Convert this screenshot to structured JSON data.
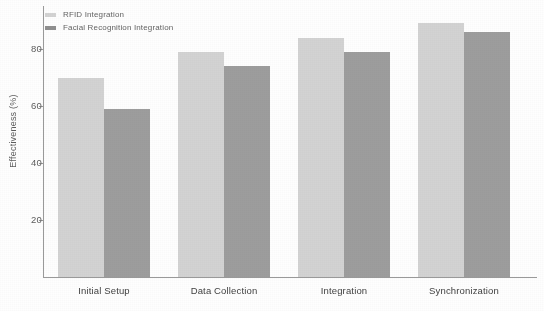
{
  "chart_data": {
    "type": "bar",
    "title": "",
    "xlabel": "",
    "ylabel": "Effectiveness (%)",
    "categories": [
      "Initial Setup",
      "Data Collection",
      "Integration",
      "Synchronization"
    ],
    "series": [
      {
        "name": "RFID Integration",
        "color": "#d3d3d3",
        "values": [
          70,
          79,
          84,
          89
        ]
      },
      {
        "name": "Facial Recognition Integration",
        "color": "#9d9d9d",
        "values": [
          59,
          74,
          79,
          86
        ]
      }
    ],
    "yticks": [
      20,
      40,
      60,
      80
    ],
    "ytick_labels": [
      "20",
      "40",
      "60",
      "80"
    ],
    "ylim": [
      0,
      93
    ],
    "grid": false,
    "legend_position": "top-left"
  },
  "legend": {
    "items": [
      {
        "label": "RFID Integration",
        "swatch": "rfid-swatch"
      },
      {
        "label": "Facial Recognition Integration",
        "swatch": "facial-swatch"
      }
    ]
  }
}
